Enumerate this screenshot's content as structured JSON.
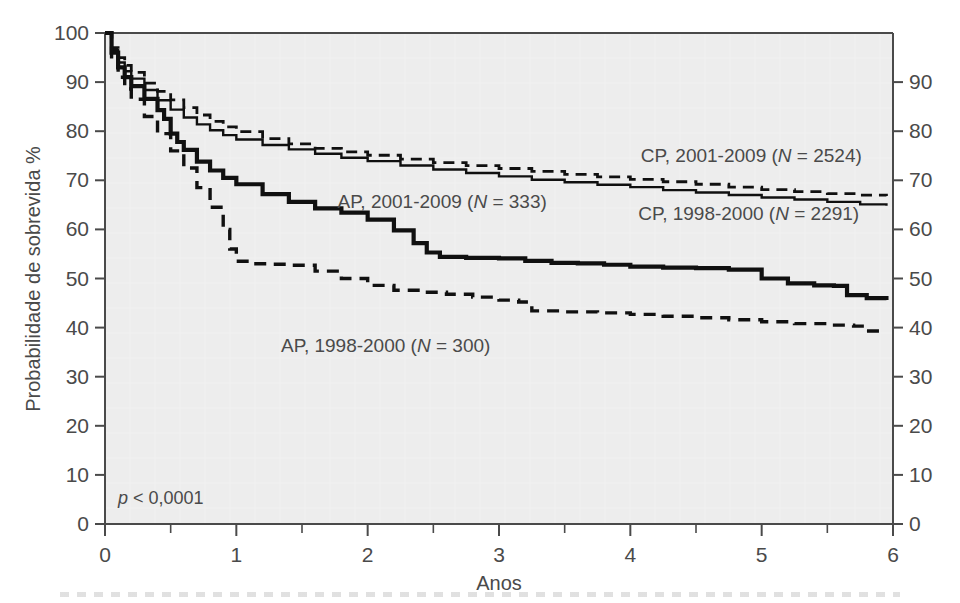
{
  "figure": {
    "background_color": "#ffffff",
    "plot_background_color": "#ededed",
    "axis_color": "#4a4a4a",
    "curve_color": "#101010"
  },
  "annotations": {
    "pvalue": "p < 0,0001",
    "pvalue_symbol": "p",
    "pvalue_rest": " < 0,0001"
  },
  "chart_data": {
    "type": "line",
    "title": "",
    "subtitle": "",
    "xlabel": "Anos",
    "ylabel": "Probabilidade de sobrevida %",
    "xlim": [
      0,
      6
    ],
    "ylim": [
      0,
      100
    ],
    "grid": false,
    "legend_position": "inline-annotations",
    "xticks": [
      0,
      1,
      2,
      3,
      4,
      5,
      6
    ],
    "xtick_labels": [
      "0",
      "1",
      "2",
      "3",
      "4",
      "5",
      "6"
    ],
    "xminor_ticks": [
      0.5,
      1.5,
      2.5,
      3.5,
      4.5,
      5.5
    ],
    "yticks": [
      0,
      10,
      20,
      30,
      40,
      50,
      60,
      70,
      80,
      90,
      100
    ],
    "ytick_labels": [
      "0",
      "10",
      "20",
      "30",
      "40",
      "50",
      "60",
      "70",
      "80",
      "90",
      "100"
    ],
    "right_axis_ticks": [
      0,
      10,
      20,
      30,
      40,
      50,
      60,
      70,
      80,
      90
    ],
    "right_axis_tick_labels": [
      "0",
      "10",
      "20",
      "30",
      "40",
      "50",
      "60",
      "70",
      "80",
      "90"
    ],
    "series": [
      {
        "name": "CP, 2001-2009",
        "label": "CP, 2001-2009 (N = 2524)",
        "label_prefix": "CP, 2001-2009 (",
        "label_symbol": "N",
        "label_suffix": " = 2524)",
        "n": 2524,
        "style": "solid-thin",
        "label_x": 4.08,
        "label_y": 73.8,
        "points": [
          [
            0.0,
            100.0
          ],
          [
            0.05,
            96.5
          ],
          [
            0.1,
            94.0
          ],
          [
            0.15,
            92.2
          ],
          [
            0.2,
            90.7
          ],
          [
            0.3,
            88.4
          ],
          [
            0.4,
            86.3
          ],
          [
            0.5,
            84.4
          ],
          [
            0.6,
            82.8
          ],
          [
            0.7,
            81.4
          ],
          [
            0.8,
            80.2
          ],
          [
            0.9,
            79.2
          ],
          [
            1.0,
            78.3
          ],
          [
            1.2,
            77.2
          ],
          [
            1.4,
            76.3
          ],
          [
            1.6,
            75.4
          ],
          [
            1.8,
            74.6
          ],
          [
            2.0,
            73.9
          ],
          [
            2.25,
            73.0
          ],
          [
            2.5,
            72.2
          ],
          [
            2.75,
            71.5
          ],
          [
            3.0,
            70.8
          ],
          [
            3.25,
            70.1
          ],
          [
            3.5,
            69.6
          ],
          [
            3.75,
            69.1
          ],
          [
            4.0,
            68.6
          ],
          [
            4.25,
            68.0
          ],
          [
            4.5,
            67.5
          ],
          [
            4.75,
            67.0
          ],
          [
            5.0,
            66.5
          ],
          [
            5.25,
            66.1
          ],
          [
            5.5,
            65.6
          ],
          [
            5.75,
            65.1
          ],
          [
            5.95,
            64.8
          ]
        ]
      },
      {
        "name": "CP, 1998-2000",
        "label": "CP, 1998-2000 (N = 2291)",
        "label_prefix": "CP, 1998-2000 (",
        "label_symbol": "N",
        "label_suffix": " = 2291)",
        "n": 2291,
        "style": "dashed-thin",
        "label_x": 4.06,
        "label_y": 62.0,
        "points": [
          [
            0.0,
            100.0
          ],
          [
            0.05,
            97.0
          ],
          [
            0.1,
            95.0
          ],
          [
            0.15,
            93.4
          ],
          [
            0.2,
            92.0
          ],
          [
            0.3,
            89.8
          ],
          [
            0.4,
            88.1
          ],
          [
            0.5,
            86.4
          ],
          [
            0.6,
            84.8
          ],
          [
            0.7,
            83.3
          ],
          [
            0.8,
            82.0
          ],
          [
            0.9,
            80.9
          ],
          [
            1.0,
            79.9
          ],
          [
            1.2,
            78.5
          ],
          [
            1.4,
            77.4
          ],
          [
            1.6,
            76.5
          ],
          [
            1.8,
            75.8
          ],
          [
            2.0,
            75.1
          ],
          [
            2.25,
            74.3
          ],
          [
            2.5,
            73.6
          ],
          [
            2.75,
            73.0
          ],
          [
            3.0,
            72.4
          ],
          [
            3.25,
            71.8
          ],
          [
            3.5,
            71.2
          ],
          [
            3.75,
            70.7
          ],
          [
            4.0,
            70.2
          ],
          [
            4.25,
            69.7
          ],
          [
            4.5,
            69.2
          ],
          [
            4.75,
            68.6
          ],
          [
            5.0,
            68.1
          ],
          [
            5.25,
            67.7
          ],
          [
            5.5,
            67.3
          ],
          [
            5.75,
            67.0
          ],
          [
            5.95,
            66.8
          ]
        ]
      },
      {
        "name": "AP, 2001-2009",
        "label": "AP, 2001-2009 (N = 333)",
        "label_prefix": "AP, 2001-2009 (",
        "label_symbol": "N",
        "label_suffix": " = 333)",
        "n": 333,
        "style": "solid-thick",
        "label_x": 1.77,
        "label_y": 64.3,
        "points": [
          [
            0.0,
            100.0
          ],
          [
            0.05,
            96.0
          ],
          [
            0.1,
            93.0
          ],
          [
            0.15,
            91.0
          ],
          [
            0.2,
            89.2
          ],
          [
            0.3,
            86.6
          ],
          [
            0.4,
            84.3
          ],
          [
            0.45,
            82.5
          ],
          [
            0.5,
            79.5
          ],
          [
            0.55,
            77.8
          ],
          [
            0.6,
            76.2
          ],
          [
            0.7,
            73.8
          ],
          [
            0.8,
            72.0
          ],
          [
            0.9,
            70.5
          ],
          [
            1.0,
            69.2
          ],
          [
            1.2,
            67.2
          ],
          [
            1.4,
            65.6
          ],
          [
            1.6,
            64.3
          ],
          [
            1.8,
            63.4
          ],
          [
            2.0,
            62.0
          ],
          [
            2.2,
            59.8
          ],
          [
            2.35,
            57.2
          ],
          [
            2.45,
            55.3
          ],
          [
            2.55,
            54.4
          ],
          [
            2.75,
            54.2
          ],
          [
            3.0,
            54.1
          ],
          [
            3.2,
            53.6
          ],
          [
            3.4,
            53.2
          ],
          [
            3.6,
            53.1
          ],
          [
            3.8,
            52.8
          ],
          [
            4.0,
            52.4
          ],
          [
            4.25,
            52.2
          ],
          [
            4.5,
            52.1
          ],
          [
            4.75,
            51.8
          ],
          [
            5.0,
            50.0
          ],
          [
            5.2,
            49.0
          ],
          [
            5.4,
            48.6
          ],
          [
            5.55,
            48.5
          ],
          [
            5.65,
            46.6
          ],
          [
            5.8,
            46.0
          ],
          [
            5.95,
            45.6
          ]
        ]
      },
      {
        "name": "AP, 1998-2000",
        "label": "AP, 1998-2000 (N = 300)",
        "label_prefix": "AP, 1998-2000 (",
        "label_symbol": "N",
        "label_suffix": " = 300)",
        "n": 300,
        "style": "dashed-thick",
        "label_x": 1.34,
        "label_y": 35.0,
        "points": [
          [
            0.0,
            100.0
          ],
          [
            0.05,
            94.5
          ],
          [
            0.1,
            91.0
          ],
          [
            0.15,
            88.6
          ],
          [
            0.2,
            86.5
          ],
          [
            0.3,
            83.0
          ],
          [
            0.4,
            79.5
          ],
          [
            0.5,
            76.0
          ],
          [
            0.6,
            72.5
          ],
          [
            0.7,
            68.5
          ],
          [
            0.8,
            64.5
          ],
          [
            0.9,
            60.0
          ],
          [
            0.95,
            56.0
          ],
          [
            1.0,
            53.5
          ],
          [
            1.1,
            53.0
          ],
          [
            1.25,
            52.9
          ],
          [
            1.4,
            52.7
          ],
          [
            1.6,
            51.5
          ],
          [
            1.8,
            50.0
          ],
          [
            2.0,
            48.6
          ],
          [
            2.2,
            47.6
          ],
          [
            2.4,
            47.2
          ],
          [
            2.6,
            46.8
          ],
          [
            2.8,
            46.2
          ],
          [
            3.0,
            45.6
          ],
          [
            3.15,
            45.2
          ],
          [
            3.25,
            43.4
          ],
          [
            3.5,
            43.2
          ],
          [
            3.75,
            43.0
          ],
          [
            4.0,
            42.7
          ],
          [
            4.25,
            42.3
          ],
          [
            4.5,
            42.0
          ],
          [
            4.75,
            41.6
          ],
          [
            5.0,
            41.2
          ],
          [
            5.25,
            40.8
          ],
          [
            5.5,
            40.5
          ],
          [
            5.7,
            40.3
          ],
          [
            5.8,
            39.3
          ],
          [
            5.95,
            39.2
          ]
        ]
      }
    ]
  }
}
